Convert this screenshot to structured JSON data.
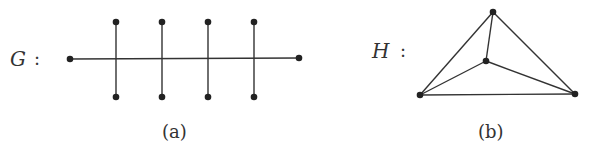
{
  "graph_g": {
    "label": "G",
    "separator": ":",
    "caption": "(a)",
    "vertices": [
      {
        "id": "e1",
        "x": 70,
        "y": 59
      },
      {
        "id": "e2",
        "x": 299,
        "y": 58
      },
      {
        "id": "t1",
        "x": 116,
        "y": 22
      },
      {
        "id": "b1",
        "x": 116,
        "y": 97
      },
      {
        "id": "t2",
        "x": 162,
        "y": 22
      },
      {
        "id": "b2",
        "x": 162,
        "y": 97
      },
      {
        "id": "t3",
        "x": 208,
        "y": 22
      },
      {
        "id": "b3",
        "x": 208,
        "y": 97
      },
      {
        "id": "t4",
        "x": 254,
        "y": 22
      },
      {
        "id": "b4",
        "x": 254,
        "y": 97
      }
    ],
    "edges": [
      [
        "e1",
        "e2"
      ],
      [
        "t1",
        "b1"
      ],
      [
        "t2",
        "b2"
      ],
      [
        "t3",
        "b3"
      ],
      [
        "t4",
        "b4"
      ]
    ]
  },
  "graph_h": {
    "label": "H",
    "separator": ":",
    "caption": "(b)",
    "vertices": [
      {
        "id": "top",
        "x": 493,
        "y": 12
      },
      {
        "id": "mid",
        "x": 486,
        "y": 61
      },
      {
        "id": "bl",
        "x": 420,
        "y": 95
      },
      {
        "id": "br",
        "x": 575,
        "y": 94
      }
    ],
    "edges": [
      [
        "top",
        "bl"
      ],
      [
        "top",
        "br"
      ],
      [
        "bl",
        "br"
      ],
      [
        "top",
        "mid"
      ],
      [
        "mid",
        "bl"
      ],
      [
        "mid",
        "br"
      ]
    ]
  },
  "style": {
    "stroke": "#333333",
    "vertex_fill": "#222222"
  }
}
